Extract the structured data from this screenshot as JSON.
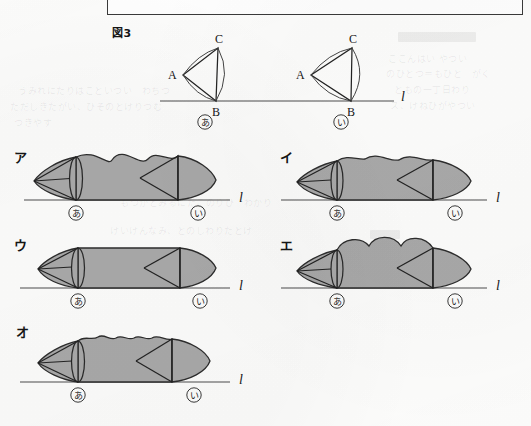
{
  "page": {
    "figure_label": "図3",
    "line_label": "l",
    "fill_color": "#a9a9a9",
    "stroke_color": "#2a2a2a"
  },
  "figure3": {
    "label": "図3",
    "shapes": [
      {
        "id": "a",
        "position_mark": "あ",
        "vertices": [
          {
            "name": "A",
            "x": 183,
            "y": 75
          },
          {
            "name": "B",
            "x": 216,
            "y": 101
          },
          {
            "name": "C",
            "x": 218,
            "y": 48
          }
        ],
        "line_label": "l"
      },
      {
        "id": "i",
        "position_mark": "い",
        "vertices": [
          {
            "name": "A",
            "x": 311,
            "y": 75
          },
          {
            "name": "B",
            "x": 351,
            "y": 101
          },
          {
            "name": "C",
            "x": 352,
            "y": 48
          }
        ],
        "line_label": "l"
      }
    ],
    "baseline": {
      "x1": 160,
      "x2": 400,
      "y": 101,
      "label": "l"
    }
  },
  "options": [
    {
      "key": "ア",
      "body_profile": "three-large-bumps-full-height",
      "start_mark": "あ",
      "end_mark": "い",
      "line_label": "l",
      "description": "両端が円すい形、胴体は大きな山が3つ"
    },
    {
      "key": "イ",
      "body_profile": "three-shallow-bumps-flat-top",
      "start_mark": "あ",
      "end_mark": "い",
      "line_label": "l",
      "description": "両端が円すい形、胴体の上部に浅い波が3つ"
    },
    {
      "key": "ウ",
      "body_profile": "flat-straight",
      "start_mark": "あ",
      "end_mark": "い",
      "line_label": "l",
      "description": "両端が円すい形、胴体はまっすぐな円柱"
    },
    {
      "key": "エ",
      "body_profile": "three-round-bumps",
      "start_mark": "あ",
      "end_mark": "い",
      "line_label": "l",
      "description": "両端が円すい形、胴体は丸い山が3つ"
    },
    {
      "key": "オ",
      "body_profile": "many-small-ripples",
      "start_mark": "あ",
      "end_mark": "い",
      "line_label": "l",
      "description": "両端が円すい形、胴体の上部に小さな波が多数"
    }
  ]
}
